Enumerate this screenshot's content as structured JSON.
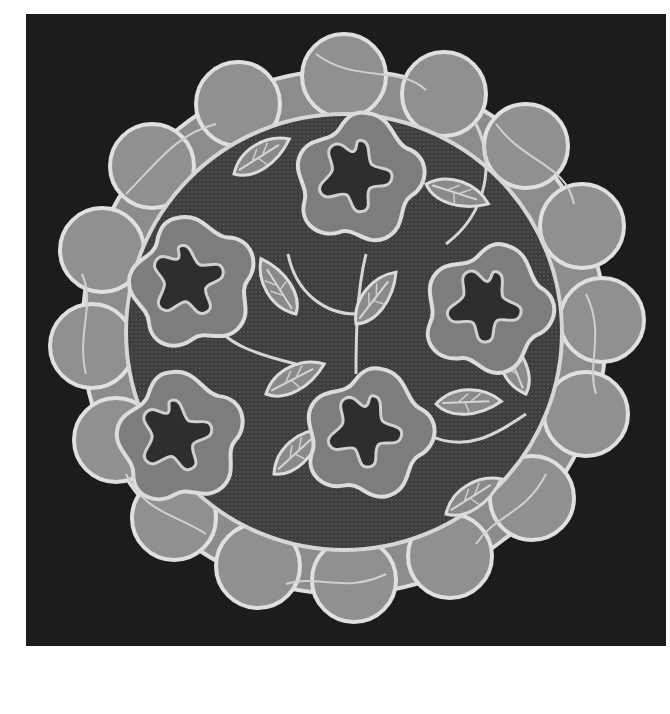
{
  "image": {
    "subject": "Round lace doily with five-petal flowers and leaves on net ground, photographed against a black background",
    "colors": {
      "background": "#1c1c1c",
      "page_margin": "#ffffff",
      "lace_outline": "#d9d9d9",
      "lace_fill": "#7a7a7a",
      "net_dark": "#3a3a3a"
    },
    "flowers": [
      {
        "cx": 330,
        "cy": 160
      },
      {
        "cx": 162,
        "cy": 265
      },
      {
        "cx": 460,
        "cy": 290
      },
      {
        "cx": 150,
        "cy": 420
      },
      {
        "cx": 340,
        "cy": 415
      }
    ]
  }
}
